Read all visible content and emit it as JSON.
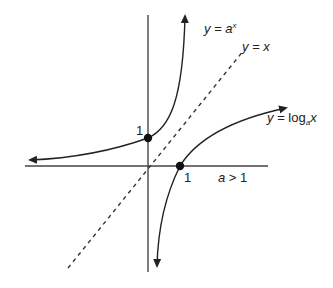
{
  "diagram": {
    "title": "",
    "colors": {
      "ink": "#222222",
      "background": "#ffffff"
    },
    "axes": {
      "x_axis": {
        "from": [
          25,
          166
        ],
        "to": [
          268,
          166
        ]
      },
      "y_axis": {
        "from": [
          148,
          15
        ],
        "to": [
          148,
          272
        ]
      }
    },
    "curves": [
      {
        "name": "exponential",
        "label_lhs": "y",
        "label_eq": "=",
        "label_base": "a",
        "label_exp": "x",
        "style": "solid",
        "points": "arrow-left, (148,138) dot, arrow-up"
      },
      {
        "name": "identity",
        "label_lhs": "y",
        "label_eq": "=",
        "label_rhs": "x",
        "style": "dashed"
      },
      {
        "name": "logarithm",
        "label_lhs": "y",
        "label_eq": "=",
        "label_fn": "log",
        "label_base": "a",
        "label_arg": "x",
        "style": "solid"
      }
    ],
    "points": [
      {
        "name": "y-intercept",
        "label": "1"
      },
      {
        "name": "x-intercept",
        "label": "1"
      }
    ],
    "condition": {
      "var": "a",
      "op": ">",
      "val": "1"
    }
  }
}
